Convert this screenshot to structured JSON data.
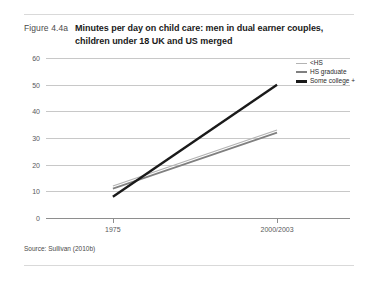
{
  "figure": {
    "number": "Figure 4.4a",
    "title": "Minutes per day on child care: men in dual earner couples, children under 18 UK and US merged",
    "source": "Source: Sullivan (2010b)"
  },
  "colors": {
    "series_low": "#b3b3b3",
    "series_mid": "#808080",
    "series_high": "#1a1a1a",
    "gridline": "#c8c8c8",
    "axis": "#8e8e8e",
    "text": "#58595b"
  },
  "chart_data": {
    "type": "line",
    "title": "Minutes per day on child care: men in dual earner couples, children under 18 UK and US merged",
    "xlabel": "",
    "ylabel": "",
    "x": [
      "1975",
      "2000/2003"
    ],
    "categories": [
      "1975",
      "2000/2003"
    ],
    "yticks": [
      0,
      10,
      20,
      30,
      40,
      50,
      60
    ],
    "ylim": [
      0,
      60
    ],
    "grid": true,
    "legend_position": "top-right",
    "series": [
      {
        "name": "<HS",
        "values": [
          12,
          33
        ],
        "color": "#b3b3b3"
      },
      {
        "name": "HS graduate",
        "values": [
          11,
          32
        ],
        "color": "#808080"
      },
      {
        "name": "Some college +",
        "values": [
          8,
          50
        ],
        "color": "#1a1a1a"
      }
    ]
  }
}
